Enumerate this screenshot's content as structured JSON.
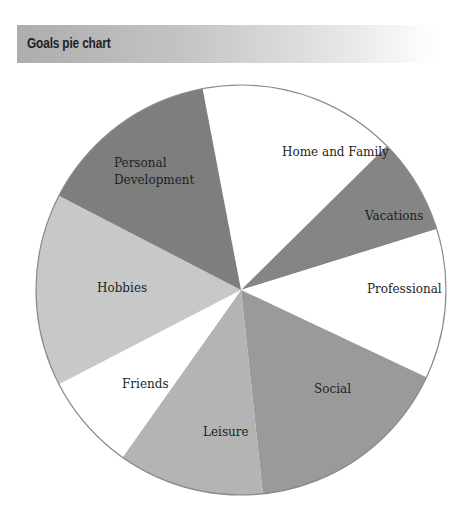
{
  "header": {
    "title": "Goals pie chart"
  },
  "chart_data": {
    "type": "pie",
    "title": "Goals pie chart",
    "start_angle_deg": 259.2,
    "direction": "clockwise",
    "center": [
      241,
      290
    ],
    "radius": 205,
    "slices": [
      {
        "label": "Home and Family",
        "value": 15.6,
        "color": "#ffffff",
        "label_lines": [
          "Home and Family"
        ],
        "label_pos": [
          282,
          156
        ]
      },
      {
        "label": "Vacations",
        "value": 7.6,
        "color": "#858585",
        "label_lines": [
          "Vacations"
        ],
        "label_pos": [
          365,
          220
        ]
      },
      {
        "label": "Professional",
        "value": 11.8,
        "color": "#ffffff",
        "label_lines": [
          "Professional"
        ],
        "label_pos": [
          367,
          293
        ]
      },
      {
        "label": "Social",
        "value": 16.3,
        "color": "#9a9a9a",
        "label_lines": [
          "Social"
        ],
        "label_pos": [
          314,
          393
        ]
      },
      {
        "label": "Leisure",
        "value": 11.5,
        "color": "#b4b4b4",
        "label_lines": [
          "Leisure"
        ],
        "label_pos": [
          203,
          436
        ]
      },
      {
        "label": "Friends",
        "value": 7.6,
        "color": "#ffffff",
        "label_lines": [
          "Friends"
        ],
        "label_pos": [
          122,
          388
        ]
      },
      {
        "label": "Hobbies",
        "value": 15.2,
        "color": "#c8c8c8",
        "label_lines": [
          "Hobbies"
        ],
        "label_pos": [
          97,
          292
        ]
      },
      {
        "label": "Personal Development",
        "value": 14.4,
        "color": "#7e7e7e",
        "label_lines": [
          "Personal",
          "Development"
        ],
        "label_pos": [
          114,
          167
        ]
      }
    ],
    "outline_color": "#8a8a8a",
    "legend": "none"
  }
}
